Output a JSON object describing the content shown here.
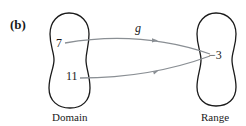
{
  "figure": {
    "panel_label": "(b)",
    "function_name": "g",
    "domain": {
      "label": "Domain",
      "elements": [
        "7",
        "11"
      ]
    },
    "range": {
      "label": "Range",
      "elements": [
        "−3"
      ]
    },
    "mappings": [
      {
        "from": "7",
        "to": "−3"
      },
      {
        "from": "11",
        "to": "−3"
      }
    ],
    "colors": {
      "outline": "#1a1a1a",
      "arrow": "#8a8f94",
      "text": "#1a1a1a"
    }
  }
}
